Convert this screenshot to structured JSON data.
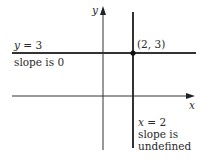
{
  "axes": {
    "x_label": "x",
    "y_label": "y"
  },
  "horizontal_line": {
    "equation_var": "y",
    "equation_rest": " = 3",
    "slope_text": "slope is 0"
  },
  "vertical_line": {
    "equation_var": "x",
    "equation_rest": " = 2",
    "slope_text_line1": "slope is",
    "slope_text_line2": "undefined"
  },
  "intersection": {
    "label": "(2, 3)"
  },
  "colors": {
    "line": "#333333",
    "text": "#2a2a2a",
    "background": "#ffffff"
  }
}
